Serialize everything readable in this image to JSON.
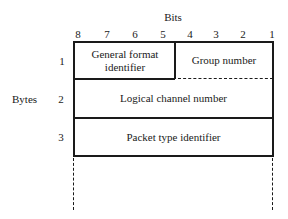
{
  "header": {
    "bits_label": "Bits",
    "bit_numbers": [
      "8",
      "7",
      "6",
      "5",
      "4",
      "3",
      "2",
      "1"
    ]
  },
  "side": {
    "bytes_label": "Bytes",
    "byte_numbers": [
      "1",
      "2",
      "3"
    ]
  },
  "fields": {
    "general_format_identifier": "General format identifier",
    "group_number": "Group number",
    "logical_channel_number": "Logical channel number",
    "packet_type_identifier": "Packet type identifier"
  }
}
